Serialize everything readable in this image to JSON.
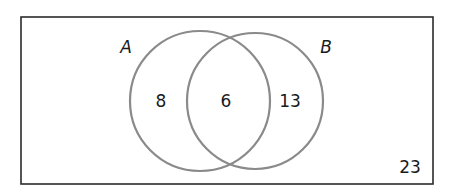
{
  "diagram": {
    "type": "venn",
    "universe": {
      "label": "",
      "outside_value": "23"
    },
    "sets": [
      {
        "name": "A",
        "label": "A",
        "only_value": "8"
      },
      {
        "name": "B",
        "label": "B",
        "only_value": "13"
      }
    ],
    "intersection": {
      "sets": [
        "A",
        "B"
      ],
      "value": "6"
    },
    "colors": {
      "circle_stroke": "#8a8a8a",
      "rectangle_stroke": "#2b2b2b",
      "text": "#1a1a1a",
      "background": "#ffffff"
    }
  }
}
